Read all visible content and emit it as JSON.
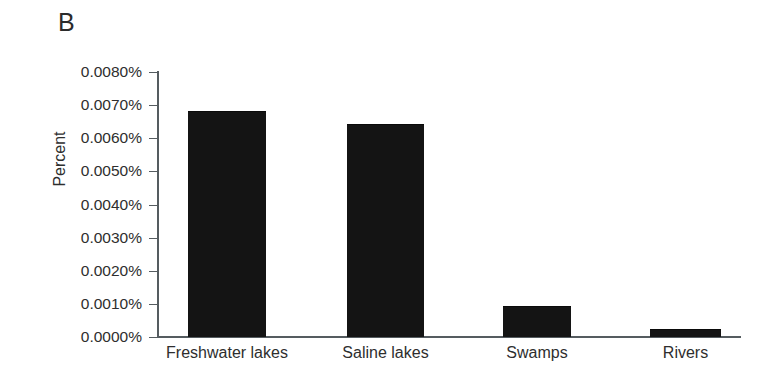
{
  "panel": {
    "label": "B"
  },
  "chart_data": {
    "type": "bar",
    "title": "",
    "subtitle": "",
    "xlabel": "",
    "ylabel": "Percent",
    "categories": [
      "Freshwater lakes",
      "Saline lakes",
      "Swamps",
      "Rivers"
    ],
    "values": [
      0.0068,
      0.0064,
      0.0009,
      0.0002
    ],
    "value_unit": "%",
    "ylim": [
      0.0,
      0.008
    ],
    "ytick_values": [
      0.008,
      0.007,
      0.006,
      0.005,
      0.004,
      0.003,
      0.002,
      0.001,
      0.0
    ],
    "ytick_labels": [
      "0.0080%",
      "0.0070%",
      "0.0060%",
      "0.0050%",
      "0.0040%",
      "0.0030%",
      "0.0020%",
      "0.0010%",
      "0.0000%"
    ],
    "grid": false,
    "legend": null,
    "legend_position": "none",
    "bar_color": "#141414",
    "axis_color": "#555c60",
    "text_color": "#2e2e2e",
    "background": "#ffffff"
  }
}
